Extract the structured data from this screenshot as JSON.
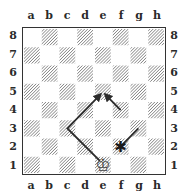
{
  "board": {
    "files": [
      "a",
      "b",
      "c",
      "d",
      "e",
      "f",
      "g",
      "h"
    ],
    "ranks": [
      "8",
      "7",
      "6",
      "5",
      "4",
      "3",
      "2",
      "1"
    ],
    "dark_square_style": "hatched",
    "pieces": [
      {
        "square": "e1",
        "piece": "king",
        "color": "white",
        "glyph": "♔"
      }
    ],
    "markers": [
      {
        "square": "f2",
        "type": "asterisk",
        "glyph": "✱"
      }
    ],
    "arrows": [
      {
        "path": [
          "e1",
          "c3",
          "e5"
        ],
        "head": true
      },
      {
        "path": [
          "f4",
          "e5"
        ],
        "head": true
      },
      {
        "path": [
          "g3",
          "f2"
        ],
        "head": false
      }
    ]
  },
  "colors": {
    "hatch": "#6b6b6b",
    "line": "#2b2b2b",
    "border": "#333333"
  }
}
